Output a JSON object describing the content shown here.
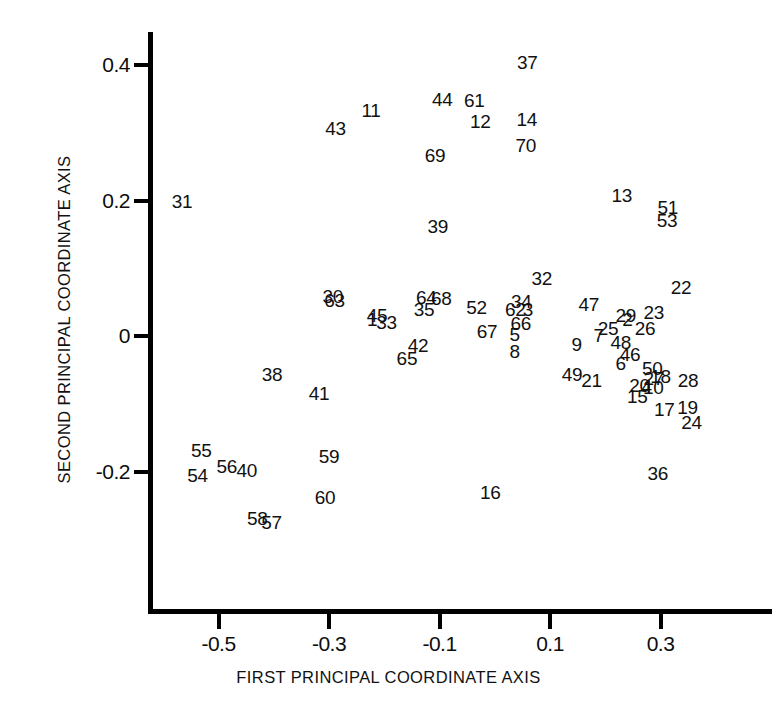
{
  "chart_data": {
    "type": "scatter",
    "title": "",
    "xlabel": "FIRST PRINCIPAL COORDINATE AXIS",
    "ylabel": "SECOND PRINCIPAL COORDINATE AXIS",
    "xlim": [
      -0.62,
      0.4
    ],
    "ylim": [
      -0.33,
      0.46
    ],
    "xticks": [
      -0.5,
      -0.3,
      -0.1,
      0.1,
      0.3
    ],
    "xticklabels": [
      "-0.5",
      "-0.3",
      "-0.1",
      "0.1",
      "0.3"
    ],
    "yticks": [
      0.4,
      0.2,
      0,
      -0.2
    ],
    "yticklabels": [
      "0.4",
      "0.2",
      "0",
      "-0.2"
    ],
    "grid": false,
    "legend": null,
    "marker": "text-label",
    "note": "Each observation is drawn as its numeric case label rather than a marker symbol.",
    "points": [
      {
        "label": "37",
        "x": 0.059,
        "y": 0.404
      },
      {
        "label": "44",
        "x": -0.095,
        "y": 0.35
      },
      {
        "label": "61",
        "x": -0.037,
        "y": 0.348
      },
      {
        "label": "11",
        "x": -0.224,
        "y": 0.333
      },
      {
        "label": "12",
        "x": -0.026,
        "y": 0.318
      },
      {
        "label": "14",
        "x": 0.058,
        "y": 0.32
      },
      {
        "label": "43",
        "x": -0.288,
        "y": 0.307
      },
      {
        "label": "70",
        "x": 0.056,
        "y": 0.282
      },
      {
        "label": "69",
        "x": -0.108,
        "y": 0.267
      },
      {
        "label": "13",
        "x": 0.23,
        "y": 0.209
      },
      {
        "label": "31",
        "x": -0.566,
        "y": 0.199
      },
      {
        "label": "51",
        "x": 0.313,
        "y": 0.191
      },
      {
        "label": "53",
        "x": 0.312,
        "y": 0.172
      },
      {
        "label": "39",
        "x": -0.103,
        "y": 0.163
      },
      {
        "label": "32",
        "x": 0.085,
        "y": 0.086
      },
      {
        "label": "22",
        "x": 0.337,
        "y": 0.073
      },
      {
        "label": "30",
        "x": -0.293,
        "y": 0.059
      },
      {
        "label": "63",
        "x": -0.29,
        "y": 0.053
      },
      {
        "label": "64",
        "x": -0.124,
        "y": 0.058
      },
      {
        "label": "68",
        "x": -0.097,
        "y": 0.057
      },
      {
        "label": "34",
        "x": 0.048,
        "y": 0.052
      },
      {
        "label": "47",
        "x": 0.17,
        "y": 0.047
      },
      {
        "label": "52",
        "x": -0.033,
        "y": 0.043
      },
      {
        "label": "35",
        "x": -0.128,
        "y": 0.041
      },
      {
        "label": "62",
        "x": 0.037,
        "y": 0.04
      },
      {
        "label": "3",
        "x": 0.06,
        "y": 0.041
      },
      {
        "label": "23",
        "x": 0.288,
        "y": 0.036
      },
      {
        "label": "1",
        "x": -0.222,
        "y": 0.026
      },
      {
        "label": "45",
        "x": -0.213,
        "y": 0.031
      },
      {
        "label": "29",
        "x": 0.237,
        "y": 0.031
      },
      {
        "label": "2",
        "x": 0.24,
        "y": 0.026
      },
      {
        "label": "33",
        "x": -0.196,
        "y": 0.021
      },
      {
        "label": "66",
        "x": 0.047,
        "y": 0.019
      },
      {
        "label": "25",
        "x": 0.205,
        "y": 0.013
      },
      {
        "label": "26",
        "x": 0.272,
        "y": 0.013
      },
      {
        "label": "67",
        "x": -0.014,
        "y": 0.008
      },
      {
        "label": "5",
        "x": 0.036,
        "y": 0.004
      },
      {
        "label": "7",
        "x": 0.188,
        "y": 0.002
      },
      {
        "label": "48",
        "x": 0.228,
        "y": -0.008
      },
      {
        "label": "42",
        "x": -0.139,
        "y": -0.013
      },
      {
        "label": "9",
        "x": 0.148,
        "y": -0.011
      },
      {
        "label": "8",
        "x": 0.036,
        "y": -0.021
      },
      {
        "label": "46",
        "x": 0.245,
        "y": -0.026
      },
      {
        "label": "65",
        "x": -0.159,
        "y": -0.032
      },
      {
        "label": "6",
        "x": 0.228,
        "y": -0.04
      },
      {
        "label": "50",
        "x": 0.285,
        "y": -0.047
      },
      {
        "label": "49",
        "x": 0.14,
        "y": -0.056
      },
      {
        "label": "38",
        "x": -0.403,
        "y": -0.055
      },
      {
        "label": "18",
        "x": 0.3,
        "y": -0.058
      },
      {
        "label": "27",
        "x": 0.288,
        "y": -0.062
      },
      {
        "label": "21",
        "x": 0.175,
        "y": -0.064
      },
      {
        "label": "28",
        "x": 0.35,
        "y": -0.065
      },
      {
        "label": "20",
        "x": 0.262,
        "y": -0.072
      },
      {
        "label": "4",
        "x": 0.275,
        "y": -0.073
      },
      {
        "label": "10",
        "x": 0.287,
        "y": -0.074
      },
      {
        "label": "41",
        "x": -0.318,
        "y": -0.084
      },
      {
        "label": "15",
        "x": 0.258,
        "y": -0.088
      },
      {
        "label": "19",
        "x": 0.349,
        "y": -0.104
      },
      {
        "label": "17",
        "x": 0.307,
        "y": -0.107
      },
      {
        "label": "24",
        "x": 0.356,
        "y": -0.126
      },
      {
        "label": "55",
        "x": -0.531,
        "y": -0.167
      },
      {
        "label": "59",
        "x": -0.3,
        "y": -0.177
      },
      {
        "label": "56",
        "x": -0.485,
        "y": -0.191
      },
      {
        "label": "40",
        "x": -0.449,
        "y": -0.197
      },
      {
        "label": "54",
        "x": -0.538,
        "y": -0.204
      },
      {
        "label": "36",
        "x": 0.295,
        "y": -0.202
      },
      {
        "label": "16",
        "x": -0.008,
        "y": -0.229
      },
      {
        "label": "60",
        "x": -0.307,
        "y": -0.237
      },
      {
        "label": "58",
        "x": -0.43,
        "y": -0.268
      },
      {
        "label": "57",
        "x": -0.404,
        "y": -0.274
      }
    ]
  },
  "axes": {
    "x_title": "FIRST PRINCIPAL COORDINATE AXIS",
    "y_title": "SECOND PRINCIPAL COORDINATE AXIS",
    "x_tick_labels": [
      "-0.5",
      "-0.3",
      "-0.1",
      "0.1",
      "0.3"
    ],
    "y_tick_labels": [
      "0.4",
      "0.2",
      "0",
      "-0.2"
    ]
  },
  "colors": {
    "axis": "#000000",
    "text": "#111111",
    "background": "#ffffff"
  }
}
